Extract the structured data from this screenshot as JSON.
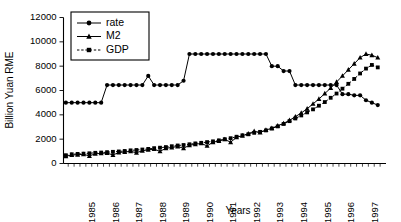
{
  "chart_data": {
    "type": "line",
    "title": "",
    "xlabel": "Years",
    "ylabel": "Billion Yuan RME",
    "ylim": [
      0,
      12000
    ],
    "ytick_labels": [
      "0",
      "2000",
      "4000",
      "6000",
      "8000",
      "10000",
      "12000"
    ],
    "ytick_values": [
      0,
      2000,
      4000,
      6000,
      8000,
      10000,
      12000
    ],
    "xtick_labels": [
      "1985",
      "1986",
      "1987",
      "1988",
      "1989",
      "1990",
      "1991",
      "1992",
      "1993",
      "1994",
      "1995",
      "1996",
      "1997"
    ],
    "xlim": [
      1984.3,
      1998.0
    ],
    "grid": false,
    "legend_position": "top-left",
    "legend": [
      "rate",
      "M2",
      "GDP"
    ],
    "x": [
      1984.4,
      1984.65,
      1984.9,
      1985.15,
      1985.4,
      1985.65,
      1985.9,
      1986.15,
      1986.4,
      1986.65,
      1986.9,
      1987.15,
      1987.4,
      1987.65,
      1987.9,
      1988.15,
      1988.4,
      1988.65,
      1988.9,
      1989.15,
      1989.4,
      1989.65,
      1989.9,
      1990.15,
      1990.4,
      1990.65,
      1990.9,
      1991.15,
      1991.4,
      1991.65,
      1991.9,
      1992.15,
      1992.4,
      1992.65,
      1992.9,
      1993.15,
      1993.4,
      1993.65,
      1993.9,
      1994.15,
      1994.4,
      1994.65,
      1994.9,
      1995.15,
      1995.4,
      1995.65,
      1995.9,
      1996.15,
      1996.4,
      1996.65,
      1996.9,
      1997.15,
      1997.4,
      1997.65
    ],
    "series": [
      {
        "name": "rate",
        "marker": "circle",
        "linestyle": "solid",
        "values": [
          5000,
          5000,
          5000,
          5000,
          5000,
          5000,
          5000,
          6450,
          6450,
          6450,
          6450,
          6450,
          6450,
          6450,
          7200,
          6450,
          6450,
          6450,
          6450,
          6450,
          6800,
          9000,
          9000,
          9000,
          9000,
          9000,
          9000,
          9000,
          9000,
          9000,
          9000,
          9000,
          9000,
          9000,
          9000,
          8000,
          8000,
          7600,
          7600,
          6450,
          6450,
          6450,
          6450,
          6450,
          6450,
          6450,
          6450,
          5700,
          5700,
          5600,
          5600,
          5200,
          5000,
          4800
        ]
      },
      {
        "name": "M2",
        "marker": "triangle",
        "linestyle": "solid",
        "values": [
          600,
          700,
          720,
          760,
          620,
          800,
          830,
          860,
          700,
          900,
          950,
          1000,
          880,
          1050,
          1120,
          1180,
          1000,
          1250,
          1320,
          1400,
          1250,
          1500,
          1580,
          1650,
          1450,
          1750,
          1850,
          1980,
          1750,
          2150,
          2280,
          2450,
          2650,
          2550,
          2750,
          2900,
          3100,
          3300,
          3550,
          3850,
          4150,
          4500,
          4900,
          5300,
          5750,
          6200,
          6700,
          7200,
          7700,
          8200,
          8700,
          9000,
          8900,
          8700
        ]
      },
      {
        "name": "GDP",
        "marker": "square",
        "linestyle": "dashed",
        "values": [
          680,
          760,
          790,
          810,
          840,
          880,
          900,
          930,
          960,
          990,
          1030,
          1080,
          1110,
          1150,
          1200,
          1260,
          1300,
          1350,
          1420,
          1480,
          1520,
          1580,
          1650,
          1700,
          1760,
          1820,
          1900,
          2000,
          2080,
          2200,
          2320,
          2400,
          2520,
          2600,
          2720,
          2880,
          3050,
          3250,
          3480,
          3700,
          3950,
          4200,
          4450,
          4750,
          5050,
          5400,
          5750,
          6150,
          6550,
          6950,
          7400,
          7800,
          8100,
          7900
        ]
      }
    ]
  }
}
